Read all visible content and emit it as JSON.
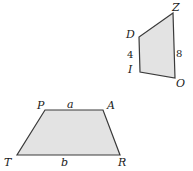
{
  "diagram": {
    "background_color": "#ffffff",
    "fill_color": "#e3e3e3",
    "stroke_color": "#3a3a3a",
    "shapes": [
      {
        "name": "trapezoid-PATR",
        "type": "trapezoid",
        "points": "45,110 103,110 120,155 17,155",
        "vertices": [
          {
            "label": "P",
            "x": 37,
            "y": 100
          },
          {
            "label": "A",
            "x": 107,
            "y": 100
          },
          {
            "label": "T",
            "x": 4,
            "y": 157
          },
          {
            "label": "R",
            "x": 118,
            "y": 157
          }
        ],
        "side_labels": [
          {
            "label": "a",
            "x": 67,
            "y": 99
          },
          {
            "label": "b",
            "x": 61,
            "y": 157
          }
        ]
      },
      {
        "name": "quadrilateral-ZDIO",
        "type": "quadrilateral",
        "points": "173,13 139,37 140,72 175,78",
        "vertices": [
          {
            "label": "Z",
            "x": 172,
            "y": 2
          },
          {
            "label": "D",
            "x": 126,
            "y": 29
          },
          {
            "label": "I",
            "x": 128,
            "y": 64
          },
          {
            "label": "O",
            "x": 176,
            "y": 78
          }
        ],
        "measure_labels": [
          {
            "label": "4",
            "x": 127,
            "y": 49
          },
          {
            "label": "8",
            "x": 176,
            "y": 48
          }
        ]
      }
    ]
  }
}
